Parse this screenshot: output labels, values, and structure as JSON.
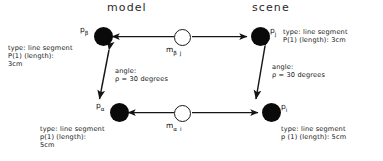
{
  "figure": {
    "headers": {
      "model": "model",
      "scene": "scene"
    },
    "nodes": [
      {
        "id": "p-beta",
        "symbol": "p",
        "subscript": "β",
        "side": "model",
        "position": "top-left"
      },
      {
        "id": "p-alpha",
        "symbol": "p",
        "subscript": "α",
        "side": "model",
        "position": "bottom-left"
      },
      {
        "id": "p-j",
        "symbol": "p",
        "subscript": "j",
        "side": "scene",
        "position": "top-right"
      },
      {
        "id": "p-i",
        "symbol": "p",
        "subscript": "i",
        "side": "scene",
        "position": "bottom-right"
      }
    ],
    "match_nodes": [
      {
        "id": "m-beta-j",
        "symbol": "m",
        "subscript": "β j",
        "position": "top-middle"
      },
      {
        "id": "m-alpha-i",
        "symbol": "m",
        "subscript": "α i",
        "position": "bottom-middle"
      }
    ],
    "annotations": {
      "top_left": {
        "line1": "type: line segment",
        "line2": "P(1) (length):",
        "line3": "3cm"
      },
      "top_right": {
        "line1": "type: line segment",
        "line2": "P(1) (length): 3cm",
        "line3": ""
      },
      "bottom_left": {
        "line1": "type: line segment",
        "line2": "p(1) (length):",
        "line3": "5cm"
      },
      "bottom_right": {
        "line1": "type: line segment",
        "line2": "p (1) (length): 5cm",
        "line3": ""
      }
    },
    "angle_labels": [
      {
        "id": "angle-model",
        "line1": "angle:",
        "line2": "ρ = 30 degrees"
      },
      {
        "id": "angle-scene",
        "line1": "angle:",
        "line2": "ρ = 30 degrees"
      }
    ],
    "colors": {
      "node_fill": "#0a0a0a",
      "edge": "#1a1a1a",
      "text": "#151515",
      "background": "#ffffff"
    }
  }
}
